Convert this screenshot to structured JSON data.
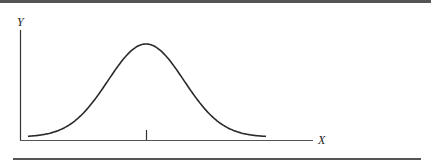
{
  "chart_data": {
    "type": "line",
    "title": "",
    "xlabel": "X",
    "ylabel": "Y",
    "grid": false,
    "legend": null,
    "x_ticks": [
      "mean"
    ],
    "series": [
      {
        "name": "bell curve",
        "x": [
          -3,
          -2.5,
          -2,
          -1.5,
          -1,
          -0.5,
          0,
          0.5,
          1,
          1.5,
          2,
          2.5,
          3
        ],
        "values": [
          0.011,
          0.044,
          0.135,
          0.325,
          0.607,
          0.882,
          1.0,
          0.882,
          0.607,
          0.325,
          0.135,
          0.044,
          0.011
        ]
      }
    ]
  },
  "labels": {
    "y_axis": "Y",
    "x_axis": "X"
  },
  "colors": {
    "ink": "#2a2a2a",
    "rule": "#555555"
  }
}
